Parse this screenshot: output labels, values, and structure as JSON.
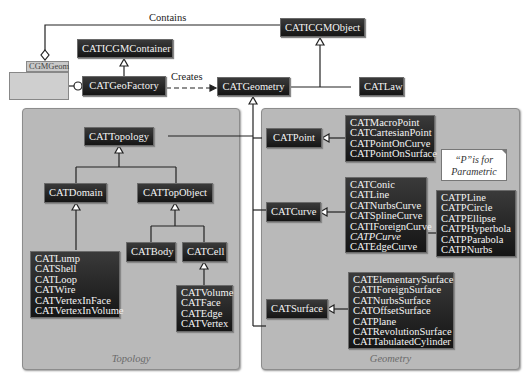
{
  "labels": {
    "contains": "Contains",
    "creates": "Creates"
  },
  "cgmgeom": {
    "label": "CGMGeom"
  },
  "classes": {
    "caticgmcontainer": "CATICGMContainer",
    "caticgmobject": "CATICGMObject",
    "catgeofactory": "CATGeoFactory",
    "catgeometry": "CATGeometry",
    "catlaw": "CATLaw",
    "cattopology": "CATTopology",
    "catdomain": "CATDomain",
    "cattopobject": "CATTopObject",
    "catbody": "CATBody",
    "catcell": "CATCell",
    "catpoint": "CATPoint",
    "catcurve": "CATCurve",
    "catsurface": "CATSurface"
  },
  "lists": {
    "domain_children": [
      "CATLump",
      "CATShell",
      "CATLoop",
      "CATWire",
      "CATVertexInFace",
      "CATVertexInVolume"
    ],
    "cell_children": [
      "CATVolume",
      "CATFace",
      "CATEdge",
      "CATVertex"
    ],
    "point_children": [
      "CATMacroPoint",
      "CATCartesianPoint",
      "CATPointOnCurve",
      "CATPointOnSurface"
    ],
    "curve_children": [
      "CATConic",
      "CATLine",
      "CATNurbsCurve",
      "CATSplineCurve",
      "CATIForeignCurve",
      "CATPCurve",
      "CATEdgeCurve"
    ],
    "pcurve_children": [
      "CATPLine",
      "CATPCircle",
      "CATPEllipse",
      "CATPHyperbola",
      "CATPParabola",
      "CATPNurbs"
    ],
    "surface_children": [
      "CATElementarySurface",
      "CATIForeignSurface",
      "CATNurbsSurface",
      "CATOffsetSurface",
      "CATPlane",
      "CATRevolutionSurface",
      "CATTabulatedCylinder"
    ]
  },
  "packages": {
    "topology": "Topology",
    "geometry": "Geometry"
  },
  "note": {
    "line1": "“P”is for",
    "line2": "Parametric"
  },
  "colors": {
    "class_bg": "#1e1e1e",
    "class_text": "#f4f4f4",
    "package_bg": "#b9b9b9",
    "line": "#222222"
  }
}
